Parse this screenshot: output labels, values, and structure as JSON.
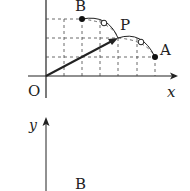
{
  "figure_top": {
    "labels": {
      "origin": "O",
      "x_axis": "x",
      "point_a": "A",
      "point_b": "B",
      "point_p": "P"
    },
    "points": {
      "O": [
        46,
        76
      ],
      "A": [
        155,
        57
      ],
      "B": [
        82,
        19
      ],
      "P": [
        118,
        38
      ]
    },
    "grid": {
      "vertical_x": [
        64,
        82,
        100,
        118,
        137,
        155
      ],
      "horizontal_y": [
        19,
        38,
        57
      ]
    },
    "open_circles": [
      [
        104,
        23
      ],
      [
        141,
        42
      ]
    ]
  },
  "figure_bottom": {
    "labels": {
      "y_axis": "y",
      "point_b": "B"
    }
  },
  "colors": {
    "ink": "#222222",
    "dash": "#444444",
    "background": "#ffffff"
  }
}
